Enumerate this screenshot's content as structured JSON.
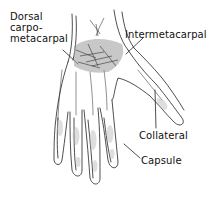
{
  "diagram": {
    "labels": [
      {
        "id": "dorsal-carpometacarpal",
        "text": "Dorsal\ncarpo-\nmetacarpal"
      },
      {
        "id": "intermetacarpal",
        "text": "Intermetacarpal"
      },
      {
        "id": "collateral",
        "text": "Collateral"
      },
      {
        "id": "capsule",
        "text": "Capsule"
      }
    ],
    "colors": {
      "line": "#222222",
      "background": "#ffffff",
      "shading": "#9a9a9a"
    }
  }
}
